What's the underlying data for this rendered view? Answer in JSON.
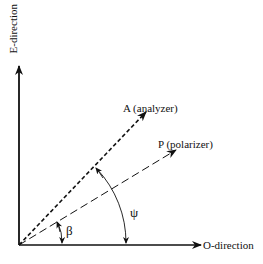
{
  "diagram": {
    "axes": {
      "vertical_label": "E-direction",
      "horizontal_label": "O-direction"
    },
    "vectors": [
      {
        "name": "A",
        "label": "A (analyzer)",
        "style": "dense-dashed"
      },
      {
        "name": "P",
        "label": "P (polarizer)",
        "style": "long-dashed"
      }
    ],
    "angles": [
      {
        "symbol": "β",
        "between": [
          "O-direction",
          "P (polarizer)"
        ]
      },
      {
        "symbol": "ψ",
        "between": [
          "O-direction",
          "A (analyzer)"
        ]
      }
    ],
    "colors": {
      "stroke": "#111111",
      "background": "#ffffff"
    }
  }
}
